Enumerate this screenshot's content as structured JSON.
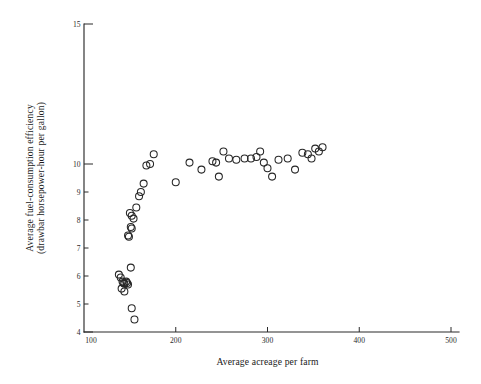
{
  "chart_data": {
    "type": "scatter",
    "title": "",
    "xlabel": "Average acreage per farm",
    "ylabel": "Average fuel-consumption efficiency\n(drawbar horsepower-hour per gallon)",
    "ylabel_line1": "Average fuel-consumption efficiency",
    "ylabel_line2": "(drawbar horsepower-hour per gallon)",
    "xlim": [
      100,
      500
    ],
    "ylim": [
      4,
      15
    ],
    "xticks": [
      100,
      200,
      300,
      400,
      500
    ],
    "xtick_labels": [
      "100",
      "200",
      "300",
      "400",
      "500"
    ],
    "yticks": [
      4,
      5,
      6,
      7,
      8,
      9,
      10,
      15
    ],
    "ytick_labels": [
      "4",
      "5",
      "6",
      "7",
      "8",
      "9",
      "10",
      "15"
    ],
    "ymajor_ticks": [
      4,
      10,
      15
    ],
    "grid": false,
    "legend": null,
    "marker": "open-circle",
    "marker_color": "#262626",
    "points": [
      [
        138,
        6.05
      ],
      [
        140,
        5.95
      ],
      [
        141,
        5.55
      ],
      [
        142,
        5.8
      ],
      [
        143,
        5.75
      ],
      [
        144,
        5.72
      ],
      [
        144,
        5.45
      ],
      [
        146,
        5.8
      ],
      [
        147,
        5.75
      ],
      [
        148,
        5.7
      ],
      [
        151,
        6.3
      ],
      [
        152,
        4.85
      ],
      [
        155,
        4.45
      ],
      [
        148,
        7.45
      ],
      [
        149,
        7.4
      ],
      [
        151,
        7.75
      ],
      [
        152,
        7.7
      ],
      [
        150,
        8.25
      ],
      [
        152,
        8.15
      ],
      [
        154,
        8.05
      ],
      [
        157,
        8.45
      ],
      [
        160,
        8.85
      ],
      [
        162,
        9.0
      ],
      [
        165,
        9.3
      ],
      [
        168,
        9.95
      ],
      [
        172,
        10.0
      ],
      [
        176,
        10.35
      ],
      [
        200,
        9.35
      ],
      [
        215,
        10.05
      ],
      [
        228,
        9.8
      ],
      [
        240,
        10.1
      ],
      [
        244,
        10.05
      ],
      [
        247,
        9.55
      ],
      [
        252,
        10.45
      ],
      [
        258,
        10.2
      ],
      [
        266,
        10.15
      ],
      [
        275,
        10.2
      ],
      [
        282,
        10.2
      ],
      [
        288,
        10.25
      ],
      [
        292,
        10.45
      ],
      [
        296,
        10.05
      ],
      [
        300,
        9.85
      ],
      [
        305,
        9.55
      ],
      [
        312,
        10.15
      ],
      [
        322,
        10.2
      ],
      [
        330,
        9.8
      ],
      [
        338,
        10.4
      ],
      [
        344,
        10.35
      ],
      [
        348,
        10.2
      ],
      [
        352,
        10.55
      ],
      [
        356,
        10.45
      ],
      [
        360,
        10.6
      ]
    ]
  }
}
